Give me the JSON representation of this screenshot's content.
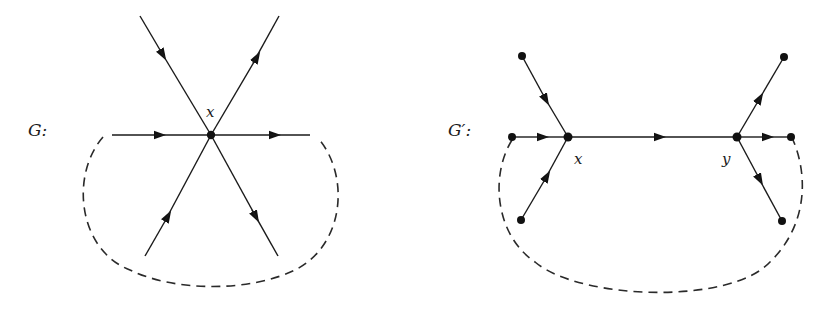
{
  "figures": [
    {
      "id": "G",
      "label": "G:",
      "vertex_labels": {
        "x": "x"
      },
      "edges": [
        {
          "from": "top-left",
          "to": "x",
          "direction": "into x"
        },
        {
          "from": "x",
          "to": "top-right",
          "direction": "out of x"
        },
        {
          "from": "left",
          "to": "x",
          "direction": "into x"
        },
        {
          "from": "x",
          "to": "right",
          "direction": "out of x"
        },
        {
          "from": "bottom-left",
          "to": "x",
          "direction": "into x"
        },
        {
          "from": "x",
          "to": "bottom-right",
          "direction": "out of x"
        }
      ],
      "boundary": "dashed arc below"
    },
    {
      "id": "G-prime",
      "label": "G′:",
      "vertex_labels": {
        "x": "x",
        "y": "y"
      },
      "edges": [
        {
          "from": "top-left-node",
          "to": "x"
        },
        {
          "from": "left-node",
          "to": "x"
        },
        {
          "from": "bottom-left-node",
          "to": "x"
        },
        {
          "from": "x",
          "to": "y"
        },
        {
          "from": "y",
          "to": "top-right-node"
        },
        {
          "from": "y",
          "to": "right-node"
        },
        {
          "from": "y",
          "to": "bottom-right-node"
        }
      ],
      "boundary": "dashed arc below"
    }
  ],
  "colors": {
    "ink": "#111111",
    "background": "#ffffff"
  }
}
